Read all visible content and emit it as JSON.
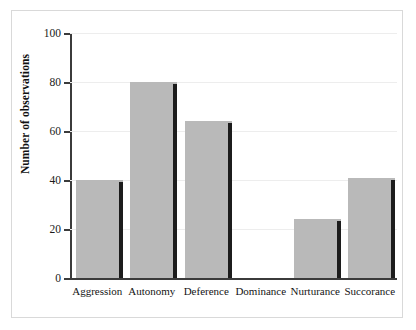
{
  "chart_data": {
    "type": "bar",
    "title": "",
    "xlabel": "",
    "ylabel": "Number of observations",
    "categories": [
      "Aggression",
      "Autonomy",
      "Deference",
      "Dominance",
      "Nurturance",
      "Succorance"
    ],
    "values": [
      40,
      80,
      64,
      0,
      24,
      41
    ],
    "ylim": [
      0,
      100
    ],
    "yticks": [
      0,
      20,
      40,
      60,
      80,
      100
    ],
    "ytick_labels": [
      "0",
      "20",
      "40",
      "60",
      "80",
      "100"
    ],
    "grid": true,
    "legend": false,
    "series": [
      {
        "name": "Number of observations",
        "values": [
          40,
          80,
          64,
          0,
          24,
          41
        ]
      }
    ],
    "colors": {
      "bar_fill": "#b9b9b9",
      "bar_shadow": "#1c1c1c",
      "axis": "#3b3b3b",
      "gridline": "#ededed",
      "frame": "#d9d9d9",
      "text": "#141414",
      "background": "#ffffff"
    }
  }
}
